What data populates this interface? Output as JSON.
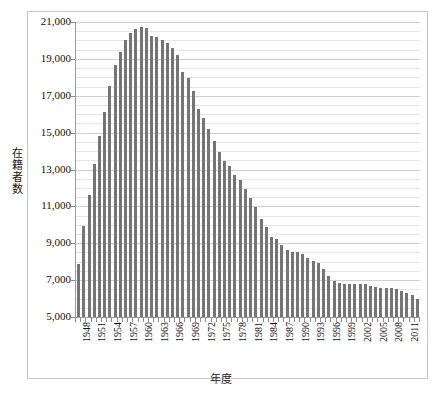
{
  "chart_data": {
    "type": "bar",
    "title": "",
    "xlabel": "年度",
    "ylabel": "在籍者数",
    "ylim": [
      5000,
      21000
    ],
    "ytick_step": 2000,
    "yminor_step": 500,
    "grid": true,
    "legend": false,
    "bar_color": "#757575",
    "gridline_color": "#d8d8d8",
    "axis_color": "#9a9a9a",
    "ytick_labels": [
      "21,000",
      "19,000",
      "17,000",
      "15,000",
      "13,000",
      "11,000",
      "9,000",
      "7,000",
      "5,000"
    ],
    "ytick_values": [
      21000,
      19000,
      17000,
      15000,
      13000,
      11000,
      9000,
      7000,
      5000
    ],
    "xtick_labels": [
      "1948",
      "1951",
      "1954",
      "1957",
      "1960",
      "1963",
      "1966",
      "1969",
      "1972",
      "1975",
      "1978",
      "1981",
      "1984",
      "1987",
      "1990",
      "1993",
      "1996",
      "1999",
      "2002",
      "2005",
      "2008",
      "2011"
    ],
    "xtick_label_step": 3,
    "categories": [
      "1948",
      "1949",
      "1950",
      "1951",
      "1952",
      "1953",
      "1954",
      "1955",
      "1956",
      "1957",
      "1958",
      "1959",
      "1960",
      "1961",
      "1962",
      "1963",
      "1964",
      "1965",
      "1966",
      "1967",
      "1968",
      "1969",
      "1970",
      "1971",
      "1972",
      "1973",
      "1974",
      "1975",
      "1976",
      "1977",
      "1978",
      "1979",
      "1980",
      "1981",
      "1982",
      "1983",
      "1984",
      "1985",
      "1986",
      "1987",
      "1988",
      "1989",
      "1990",
      "1991",
      "1992",
      "1993",
      "1994",
      "1995",
      "1996",
      "1997",
      "1998",
      "1999",
      "2000",
      "2001",
      "2002",
      "2003",
      "2004",
      "2005",
      "2006",
      "2007",
      "2008",
      "2009",
      "2010",
      "2011",
      "2012",
      "2013"
    ],
    "values": [
      7900,
      9950,
      11600,
      13300,
      14800,
      16100,
      17550,
      18650,
      19400,
      20050,
      20400,
      20600,
      20750,
      20700,
      20250,
      20200,
      20050,
      19850,
      19600,
      19200,
      18300,
      17950,
      17250,
      16300,
      15800,
      15200,
      14550,
      13950,
      13450,
      13200,
      12700,
      12450,
      11950,
      11450,
      10950,
      10300,
      9900,
      9350,
      9250,
      8900,
      8650,
      8550,
      8500,
      8400,
      8200,
      8050,
      7950,
      7600,
      7250,
      6950,
      6850,
      6800,
      6800,
      6800,
      6800,
      6800,
      6700,
      6650,
      6600,
      6550,
      6550,
      6500,
      6400,
      6300,
      6200,
      5950
    ]
  },
  "axis": {
    "y_title": "在籍者数",
    "y_title_chars": [
      "在",
      "籍",
      "者",
      "数"
    ],
    "x_title": "年度"
  }
}
